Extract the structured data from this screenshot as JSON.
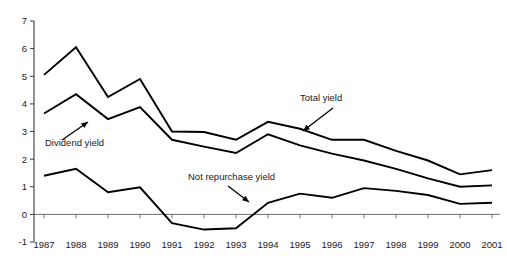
{
  "chart_data": {
    "type": "line",
    "title": "",
    "xlabel": "",
    "ylabel": "",
    "categories": [
      "1987",
      "1988",
      "1989",
      "1990",
      "1991",
      "1992",
      "1993",
      "1994",
      "1995",
      "1996",
      "1997",
      "1998",
      "1999",
      "2000",
      "2001"
    ],
    "x": [
      1987,
      1988,
      1989,
      1990,
      1991,
      1992,
      1993,
      1994,
      1995,
      1996,
      1997,
      1998,
      1999,
      2000,
      2001
    ],
    "ylim": [
      -1,
      7
    ],
    "yticks": [
      -1,
      0,
      1,
      2,
      3,
      4,
      5,
      6,
      7
    ],
    "ytick_labels": [
      "-1",
      "0",
      "1",
      "2",
      "3",
      "4",
      "5",
      "6",
      "7"
    ],
    "grid": false,
    "legend": "annotations",
    "series": [
      {
        "name": "Total yield",
        "values": [
          5.05,
          6.05,
          4.25,
          4.9,
          3.0,
          2.98,
          2.7,
          3.35,
          3.1,
          2.7,
          2.7,
          2.3,
          1.95,
          1.45,
          1.6
        ]
      },
      {
        "name": "Dividend yield",
        "values": [
          3.65,
          4.35,
          3.45,
          3.88,
          2.7,
          2.45,
          2.22,
          2.9,
          2.5,
          2.2,
          1.95,
          1.65,
          1.3,
          1.0,
          1.05
        ]
      },
      {
        "name": "Not repurchase yield",
        "values": [
          1.4,
          1.65,
          0.8,
          0.98,
          -0.32,
          -0.55,
          -0.5,
          0.42,
          0.75,
          0.6,
          0.95,
          0.85,
          0.7,
          0.38,
          0.42
        ]
      }
    ],
    "annotations": [
      {
        "label": "Total yield",
        "target_series": "Total yield",
        "target_x": 1995
      },
      {
        "label": "Dividend yield",
        "target_series": "Dividend yield",
        "target_x": 1989
      },
      {
        "label": "Not repurchase yield",
        "target_series": "Not repurchase yield",
        "target_x": 1994
      }
    ]
  },
  "axes": {
    "y_axis_name": "value-axis",
    "x_axis_name": "year-axis"
  }
}
